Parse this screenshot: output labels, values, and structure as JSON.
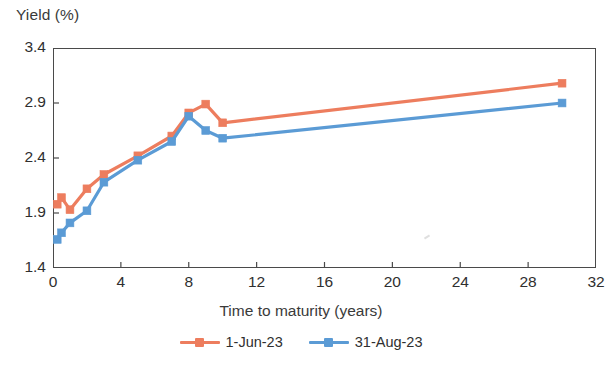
{
  "chart_data": {
    "type": "line",
    "title": "",
    "ylabel": "Yield (%)",
    "xlabel": "Time to maturity (years)",
    "xlim": [
      0,
      32
    ],
    "ylim": [
      1.4,
      3.4
    ],
    "xticks": [
      0,
      4,
      8,
      12,
      16,
      20,
      24,
      28,
      32
    ],
    "yticks": [
      1.4,
      1.9,
      2.4,
      2.9,
      3.4
    ],
    "xtick_labels": [
      "0",
      "4",
      "8",
      "12",
      "16",
      "20",
      "24",
      "28",
      "32"
    ],
    "ytick_labels": [
      "1.4",
      "1.9",
      "2.4",
      "2.9",
      "3.4"
    ],
    "grid": false,
    "legend_position": "bottom-center",
    "markers": "square",
    "series": [
      {
        "name": "1-Jun-23",
        "color": "#ED7D5E",
        "x": [
          0.25,
          0.5,
          1,
          2,
          3,
          5,
          7,
          8,
          9,
          10,
          30
        ],
        "values": [
          1.98,
          2.04,
          1.93,
          2.12,
          2.25,
          2.42,
          2.6,
          2.81,
          2.89,
          2.72,
          3.08
        ]
      },
      {
        "name": "31-Aug-23",
        "color": "#5B9BD5",
        "x": [
          0.25,
          0.5,
          1,
          2,
          3,
          5,
          7,
          8,
          9,
          10,
          30
        ],
        "values": [
          1.66,
          1.72,
          1.81,
          1.92,
          2.18,
          2.38,
          2.55,
          2.78,
          2.65,
          2.58,
          2.9
        ]
      }
    ]
  },
  "legend": {
    "entries": [
      {
        "label": "1-Jun-23",
        "color": "#ED7D5E"
      },
      {
        "label": "31-Aug-23",
        "color": "#5B9BD5"
      }
    ]
  },
  "axes": {
    "y_title": "Yield (%)",
    "x_title": "Time to maturity (years)"
  },
  "colors": {
    "series_1": "#ED7D5E",
    "series_2": "#5B9BD5",
    "axis": "#4a4a4a",
    "text": "#2f2f2f",
    "background": "#ffffff"
  }
}
